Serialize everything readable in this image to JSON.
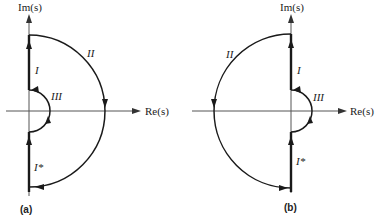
{
  "panels": [
    {
      "id": "a",
      "panel_label": "(a)",
      "imaginary_axis_label": "Im(s)",
      "real_axis_label": "Re(s)",
      "contour_labels": {
        "positive_imag_segment": "I",
        "large_arc": "II",
        "small_arc": "III",
        "negative_imag_segment": "I*"
      },
      "large_arc_side": "right",
      "small_arc_side": "right"
    },
    {
      "id": "b",
      "panel_label": "(b)",
      "imaginary_axis_label": "Im(s)",
      "real_axis_label": "Re(s)",
      "contour_labels": {
        "positive_imag_segment": "I",
        "large_arc": "II",
        "small_arc": "III",
        "negative_imag_segment": "I*"
      },
      "large_arc_side": "left",
      "small_arc_side": "right"
    }
  ]
}
